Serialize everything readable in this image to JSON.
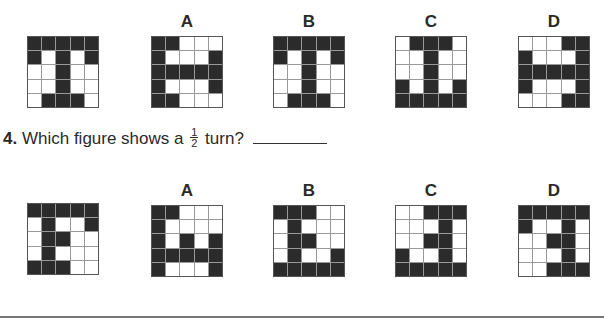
{
  "question3": {
    "original": {
      "x": 27,
      "y": 36,
      "rows": [
        [
          1,
          1,
          1,
          1,
          1
        ],
        [
          1,
          0,
          1,
          0,
          1
        ],
        [
          0,
          0,
          1,
          0,
          0
        ],
        [
          0,
          0,
          1,
          0,
          0
        ],
        [
          0,
          1,
          1,
          1,
          0
        ]
      ]
    },
    "options": [
      {
        "label": "A",
        "x": 151,
        "y": 36,
        "rows": [
          [
            1,
            1,
            0,
            0,
            0
          ],
          [
            1,
            0,
            0,
            0,
            1
          ],
          [
            1,
            1,
            1,
            1,
            1
          ],
          [
            1,
            0,
            0,
            0,
            1
          ],
          [
            1,
            1,
            0,
            0,
            0
          ]
        ]
      },
      {
        "label": "B",
        "x": 273,
        "y": 36,
        "rows": [
          [
            1,
            1,
            1,
            1,
            1
          ],
          [
            1,
            0,
            1,
            0,
            1
          ],
          [
            0,
            0,
            1,
            0,
            0
          ],
          [
            0,
            0,
            1,
            0,
            0
          ],
          [
            0,
            1,
            1,
            1,
            0
          ]
        ]
      },
      {
        "label": "C",
        "x": 395,
        "y": 36,
        "rows": [
          [
            0,
            1,
            1,
            1,
            0
          ],
          [
            0,
            0,
            1,
            0,
            0
          ],
          [
            0,
            0,
            1,
            0,
            0
          ],
          [
            1,
            0,
            1,
            0,
            1
          ],
          [
            1,
            1,
            1,
            1,
            1
          ]
        ]
      },
      {
        "label": "D",
        "x": 518,
        "y": 36,
        "rows": [
          [
            0,
            0,
            0,
            1,
            1
          ],
          [
            1,
            0,
            0,
            0,
            1
          ],
          [
            1,
            1,
            1,
            1,
            1
          ],
          [
            1,
            0,
            0,
            0,
            1
          ],
          [
            0,
            0,
            0,
            1,
            1
          ]
        ]
      }
    ]
  },
  "question4": {
    "number": "4.",
    "text_before": "Which figure shows a",
    "fraction_num": "1",
    "fraction_den": "2",
    "text_after": "turn?",
    "original": {
      "x": 27,
      "y": 203,
      "rows": [
        [
          1,
          1,
          1,
          1,
          1
        ],
        [
          0,
          1,
          0,
          0,
          1
        ],
        [
          0,
          1,
          1,
          0,
          0
        ],
        [
          0,
          1,
          0,
          0,
          0
        ],
        [
          1,
          1,
          1,
          0,
          0
        ]
      ]
    },
    "options": [
      {
        "label": "A",
        "x": 151,
        "y": 205,
        "rows": [
          [
            1,
            1,
            0,
            0,
            0
          ],
          [
            1,
            0,
            0,
            0,
            0
          ],
          [
            1,
            0,
            1,
            0,
            1
          ],
          [
            1,
            1,
            1,
            1,
            1
          ],
          [
            1,
            0,
            0,
            0,
            1
          ]
        ]
      },
      {
        "label": "B",
        "x": 273,
        "y": 205,
        "rows": [
          [
            1,
            1,
            1,
            0,
            0
          ],
          [
            0,
            1,
            0,
            0,
            0
          ],
          [
            0,
            1,
            1,
            0,
            0
          ],
          [
            0,
            1,
            0,
            0,
            1
          ],
          [
            1,
            1,
            1,
            1,
            1
          ]
        ]
      },
      {
        "label": "C",
        "x": 395,
        "y": 205,
        "rows": [
          [
            0,
            0,
            1,
            1,
            1
          ],
          [
            0,
            0,
            0,
            1,
            0
          ],
          [
            0,
            0,
            1,
            1,
            0
          ],
          [
            1,
            0,
            0,
            1,
            0
          ],
          [
            1,
            1,
            1,
            1,
            1
          ]
        ]
      },
      {
        "label": "D",
        "x": 518,
        "y": 205,
        "rows": [
          [
            1,
            1,
            1,
            1,
            1
          ],
          [
            1,
            0,
            0,
            1,
            0
          ],
          [
            0,
            0,
            1,
            1,
            0
          ],
          [
            0,
            0,
            0,
            1,
            0
          ],
          [
            0,
            0,
            1,
            1,
            1
          ]
        ]
      }
    ]
  }
}
